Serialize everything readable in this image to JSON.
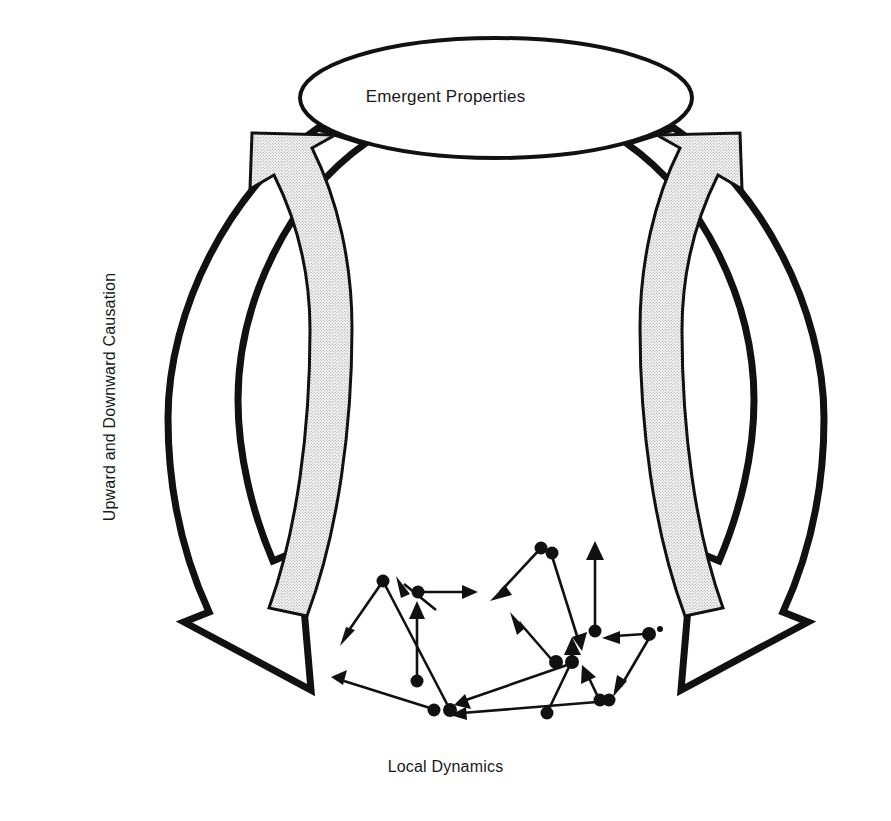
{
  "diagram": {
    "title_node": {
      "label": "Emergent Properties",
      "shape": "ellipse",
      "fill": "#ffffff",
      "stroke": "#111111"
    },
    "bottom_node": {
      "label": "Local Dynamics",
      "shape": "node-network"
    },
    "axis_label": {
      "label": "Upward and Downward Causation",
      "orientation": "vertical-rotated-90ccw"
    },
    "arrows": [
      {
        "name": "left-outer-downward-arrow",
        "direction": "downward",
        "fill": "#ffffff",
        "stroke": "#111111",
        "meaning": "downward causation"
      },
      {
        "name": "left-inner-upward-arrow",
        "direction": "upward",
        "fill": "#d9d9d9",
        "stroke": "#111111",
        "meaning": "upward causation"
      },
      {
        "name": "right-outer-downward-arrow",
        "direction": "downward",
        "fill": "#ffffff",
        "stroke": "#111111",
        "meaning": "downward causation"
      },
      {
        "name": "right-inner-upward-arrow",
        "direction": "upward",
        "fill": "#d9d9d9",
        "stroke": "#111111",
        "meaning": "upward causation"
      }
    ],
    "colors": {
      "ink": "#111111",
      "arrow_shading": "#d9d9d9",
      "background": "#ffffff"
    },
    "network": {
      "dot_color": "#111111",
      "dot_radius": 6,
      "nodes": [
        [
          383,
          581
        ],
        [
          418,
          592
        ],
        [
          417,
          681
        ],
        [
          434,
          710
        ],
        [
          450,
          710
        ],
        [
          541,
          548
        ],
        [
          551,
          553
        ],
        [
          595,
          631
        ],
        [
          556,
          662
        ],
        [
          572,
          662
        ],
        [
          600,
          700
        ],
        [
          608,
          700
        ],
        [
          547,
          713
        ],
        [
          649,
          634
        ],
        [
          660,
          631
        ]
      ],
      "edges": [
        {
          "from": [
            383,
            581
          ],
          "to": [
            340,
            643
          ]
        },
        {
          "from": [
            383,
            581
          ],
          "to": [
            450,
            710
          ]
        },
        {
          "from": [
            436,
            604
          ],
          "to": [
            401,
            578
          ]
        },
        {
          "from": [
            418,
            592
          ],
          "to": [
            475,
            592
          ]
        },
        {
          "from": [
            417,
            681
          ],
          "to": [
            417,
            607
          ]
        },
        {
          "from": [
            434,
            710
          ],
          "to": [
            333,
            678
          ]
        },
        {
          "from": [
            541,
            548
          ],
          "to": [
            492,
            600
          ]
        },
        {
          "from": [
            551,
            553
          ],
          "to": [
            580,
            646
          ]
        },
        {
          "from": [
            595,
            631
          ],
          "to": [
            595,
            546
          ]
        },
        {
          "from": [
            556,
            662
          ],
          "to": [
            512,
            617
          ]
        },
        {
          "from": [
            572,
            662
          ],
          "to": [
            457,
            703
          ]
        },
        {
          "from": [
            572,
            662
          ],
          "to": [
            572,
            642
          ]
        },
        {
          "from": [
            547,
            713
          ],
          "to": [
            572,
            662
          ]
        },
        {
          "from": [
            600,
            700
          ],
          "to": [
            583,
            670
          ]
        },
        {
          "from": [
            600,
            700
          ],
          "to": [
            452,
            715
          ]
        },
        {
          "from": [
            649,
            634
          ],
          "to": [
            605,
            638
          ]
        },
        {
          "from": [
            649,
            634
          ],
          "to": [
            614,
            693
          ]
        }
      ]
    }
  }
}
